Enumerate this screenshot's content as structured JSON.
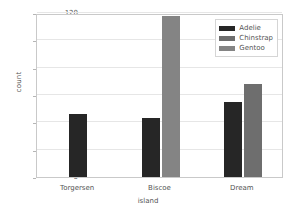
{
  "chart_data": {
    "type": "bar",
    "title": "",
    "xlabel": "island",
    "ylabel": "count",
    "categories": [
      "Torgersen",
      "Biscoe",
      "Dream"
    ],
    "series": [
      {
        "name": "Adelie",
        "color": "#262626",
        "values": [
          46,
          43,
          55
        ]
      },
      {
        "name": "Chinstrap",
        "color": "#6e6e6e",
        "values": [
          0,
          0,
          68
        ]
      },
      {
        "name": "Gentoo",
        "color": "#848484",
        "values": [
          0,
          118,
          0
        ]
      }
    ],
    "ylim": [
      0,
      120
    ],
    "yticks": [
      0,
      20,
      40,
      60,
      80,
      100,
      120
    ],
    "ytick_labels": [
      "0",
      "20",
      "40",
      "60",
      "80",
      "100",
      "120"
    ],
    "grid": "horizontal",
    "legend_position": "upper right",
    "legend_entries": [
      "Adelie",
      "Chinstrap",
      "Gentoo"
    ]
  },
  "axis": {
    "y_label": "count",
    "x_label": "island",
    "y_ticks": [
      "0",
      "20",
      "40",
      "60",
      "80",
      "100",
      "120"
    ],
    "x_ticks": [
      "Torgersen",
      "Biscoe",
      "Dream"
    ]
  },
  "legend": {
    "items": [
      {
        "label": "Adelie"
      },
      {
        "label": "Chinstrap"
      },
      {
        "label": "Gentoo"
      }
    ]
  }
}
